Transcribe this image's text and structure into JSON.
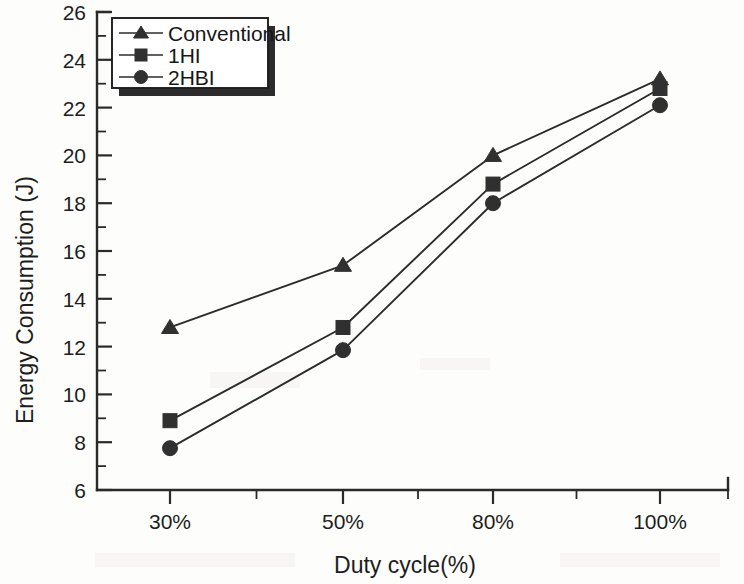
{
  "chart_data": {
    "type": "line",
    "title": "",
    "xlabel": "Duty cycle(%)",
    "ylabel": "Energy Consumption (J)",
    "categories": [
      "30%",
      "50%",
      "80%",
      "100%"
    ],
    "ylim": [
      6,
      26
    ],
    "ytick_labels": [
      "6",
      "8",
      "10",
      "12",
      "14",
      "16",
      "18",
      "20",
      "22",
      "24",
      "26"
    ],
    "ytick_values": [
      6,
      8,
      10,
      12,
      14,
      16,
      18,
      20,
      22,
      24,
      26
    ],
    "minor_ticks": true,
    "grid": false,
    "legend_position": "top-left",
    "series": [
      {
        "name": "Conventional",
        "marker": "triangle",
        "values": [
          12.8,
          15.4,
          20.0,
          23.2
        ]
      },
      {
        "name": "1HI",
        "marker": "square",
        "values": [
          8.9,
          12.8,
          18.8,
          22.8
        ]
      },
      {
        "name": "2HBI",
        "marker": "circle",
        "values": [
          7.75,
          11.85,
          18.0,
          22.1
        ]
      }
    ],
    "colors": {
      "line": "#2b2b2b",
      "marker": "#303030",
      "axis": "#2a2a2a",
      "background": "#fdfdfc"
    }
  },
  "legend": {
    "entries": [
      {
        "label": "Conventional",
        "marker": "triangle"
      },
      {
        "label": "1HI",
        "marker": "square"
      },
      {
        "label": "2HBI",
        "marker": "circle"
      }
    ]
  },
  "axes": {
    "x_title": "Duty cycle(%)",
    "y_title": "Energy Consumption (J)",
    "x_tick_labels": [
      "30%",
      "50%",
      "80%",
      "100%"
    ],
    "y_tick_labels": [
      "26",
      "24",
      "22",
      "20",
      "18",
      "16",
      "14",
      "12",
      "10",
      "8",
      "6"
    ]
  }
}
